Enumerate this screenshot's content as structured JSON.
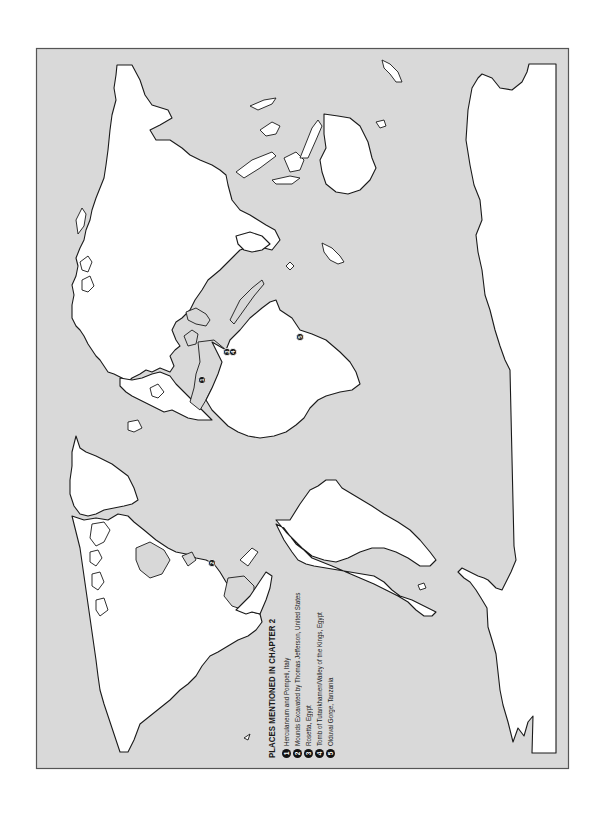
{
  "map": {
    "orientation": "rotated 90 degrees counter-clockwise",
    "colors": {
      "ocean": "#d9d9d9",
      "land": "#ffffff",
      "coastline": "#1a1a1a",
      "frame": "#555555",
      "marker": "#111111"
    },
    "markers": [
      {
        "id": "1",
        "x": 202,
        "y": 380
      },
      {
        "id": "2",
        "x": 212,
        "y": 563
      },
      {
        "id": "3",
        "x": 227,
        "y": 352
      },
      {
        "id": "4",
        "x": 233,
        "y": 352
      },
      {
        "id": "5",
        "x": 300,
        "y": 337
      }
    ]
  },
  "legend": {
    "title": "PLACES MENTIONED IN CHAPTER 2",
    "items": [
      {
        "num": "1",
        "label": "Herculaneum and Pompeii, Italy"
      },
      {
        "num": "2",
        "label": "Mounds Excavated by Thomas Jefferson, United States"
      },
      {
        "num": "3",
        "label": "Rosetta, Egypt"
      },
      {
        "num": "4",
        "label": "Tomb of Tutankhamen/Valley of the Kings, Egypt"
      },
      {
        "num": "5",
        "label": "Olduvai Gorge, Tanzania"
      }
    ]
  }
}
